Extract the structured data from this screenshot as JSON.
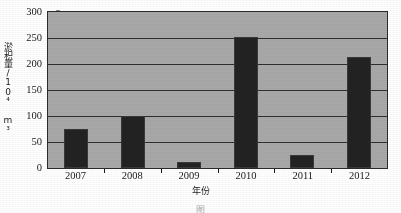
{
  "chart_data": {
    "type": "bar",
    "title": "",
    "categories": [
      "2007",
      "2008",
      "2009",
      "2010",
      "2011",
      "2012"
    ],
    "values": [
      75,
      100,
      12,
      252,
      25,
      214
    ],
    "series": [
      {
        "name": "淤积量",
        "values": [
          75,
          100,
          12,
          252,
          25,
          214
        ]
      }
    ],
    "xlabel": "年份",
    "ylabel": "淤积量/10⁴ m³",
    "ylim": [
      0,
      300
    ],
    "yticks": [
      0,
      50,
      100,
      150,
      200,
      250,
      300
    ],
    "ytick_labels": [
      "0",
      "50",
      "100",
      "150",
      "200",
      "250",
      "300"
    ],
    "grid": "horizontal",
    "legend": "none",
    "bar_color": "#232323",
    "plot_background": "#a9a9a9",
    "axis_color": "#2b2b2b"
  },
  "axes": {
    "y_title": "淤积量/10⁴ m³",
    "x_title": "年份"
  },
  "caption": {
    "text": "图"
  }
}
